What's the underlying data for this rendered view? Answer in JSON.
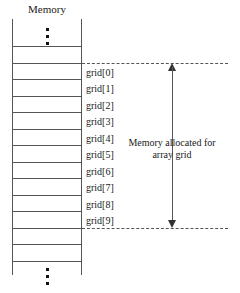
{
  "diagram": {
    "title": "Memory",
    "memory_column": {
      "top_ellipsis": "vertical-ellipsis",
      "bottom_ellipsis": "vertical-ellipsis",
      "cell_count_labeled": 10,
      "unlabeled_cells_top": 2,
      "unlabeled_cells_bottom": 2
    },
    "cells": [
      {
        "label": "grid[0]"
      },
      {
        "label": "grid[1]"
      },
      {
        "label": "grid[2]"
      },
      {
        "label": "grid[3]"
      },
      {
        "label": "grid[4]"
      },
      {
        "label": "grid[5]"
      },
      {
        "label": "grid[6]"
      },
      {
        "label": "grid[7]"
      },
      {
        "label": "grid[8]"
      },
      {
        "label": "grid[9]"
      }
    ],
    "annotation": {
      "line1": "Memory allocated for",
      "line2": "array grid"
    },
    "colors": {
      "stroke": "#555555",
      "text": "#1a1a1a",
      "background": "#ffffff"
    }
  }
}
